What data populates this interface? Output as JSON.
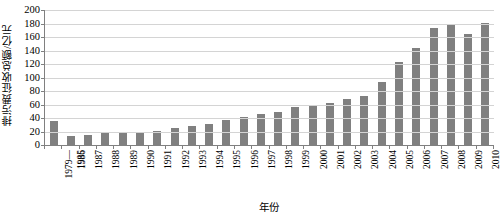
{
  "chart_data": {
    "type": "bar",
    "title": "",
    "xlabel": "年份",
    "ylabel": "排污费征收总额/亿元",
    "ylim": [
      0,
      200
    ],
    "ytick_step": 20,
    "yticks": [
      200,
      180,
      160,
      140,
      120,
      100,
      80,
      60,
      40,
      20,
      0
    ],
    "grid": true,
    "legend": false,
    "bar_color": "#808080",
    "axis_color": "#808080",
    "gridline_color": "#d4d4d4",
    "categories": [
      "1979—1985",
      "1986",
      "1987",
      "1988",
      "1989",
      "1990",
      "1991",
      "1992",
      "1993",
      "1994",
      "1995",
      "1996",
      "1997",
      "1998",
      "1999",
      "2000",
      "2001",
      "2002",
      "2003",
      "2004",
      "2005",
      "2006",
      "2007",
      "2008",
      "2009",
      "2010"
    ],
    "category_lines": [
      [
        "1979—",
        "1985"
      ],
      [
        "1986"
      ],
      [
        "1987"
      ],
      [
        "1988"
      ],
      [
        "1989"
      ],
      [
        "1990"
      ],
      [
        "1991"
      ],
      [
        "1992"
      ],
      [
        "1993"
      ],
      [
        "1994"
      ],
      [
        "1995"
      ],
      [
        "1996"
      ],
      [
        "1997"
      ],
      [
        "1998"
      ],
      [
        "1999"
      ],
      [
        "2000"
      ],
      [
        "2001"
      ],
      [
        "2002"
      ],
      [
        "2003"
      ],
      [
        "2004"
      ],
      [
        "2005"
      ],
      [
        "2006"
      ],
      [
        "2007"
      ],
      [
        "2008"
      ],
      [
        "2009"
      ],
      [
        "2010"
      ]
    ],
    "values": [
      36,
      13,
      15,
      18,
      18,
      19,
      21,
      25,
      28,
      31,
      37,
      41,
      46,
      49,
      56,
      59,
      62,
      68,
      72,
      94,
      123,
      144,
      174,
      178,
      165,
      181
    ],
    "series": [
      {
        "name": "排污费征收总额",
        "values": [
          36,
          13,
          15,
          18,
          18,
          19,
          21,
          25,
          28,
          31,
          37,
          41,
          46,
          49,
          56,
          59,
          62,
          68,
          72,
          94,
          123,
          144,
          174,
          178,
          165,
          181
        ]
      }
    ]
  }
}
